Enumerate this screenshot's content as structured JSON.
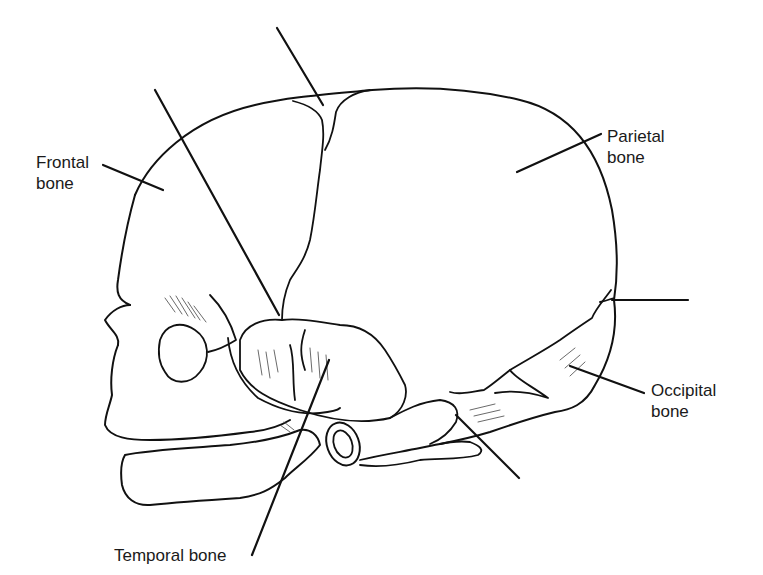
{
  "diagram": {
    "labels": {
      "frontal": {
        "line1": "Frontal",
        "line2": "bone"
      },
      "parietal": {
        "line1": "Parietal",
        "line2": "bone"
      },
      "occipital": {
        "line1": "Occipital",
        "line2": "bone"
      },
      "temporal": {
        "text": "Temporal bone"
      }
    },
    "unlabeled_leaders": [
      "anterior-fontanelle-pointer",
      "sphenoidal-fontanelle-pointer",
      "posterior-fontanelle-pointer",
      "mastoid-fontanelle-pointer"
    ],
    "colors": {
      "line": "#111111",
      "background": "#ffffff",
      "text": "#1a1a1a"
    }
  }
}
